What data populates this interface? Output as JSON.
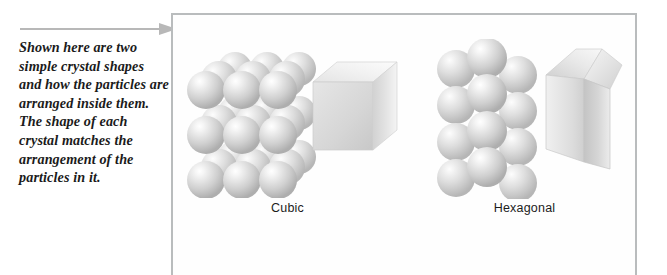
{
  "caption": {
    "text": "Shown here are two simple crystal shapes and how the particles are arranged inside them. The shape of each crystal matches the arrangement of the particles in it."
  },
  "arrow": {
    "icon": "arrow-right-icon",
    "color": "#b8b8b8",
    "direction": "right"
  },
  "panel": {
    "border_color": "#b9bcbd",
    "background": "#fefefe"
  },
  "figures": [
    {
      "id": "cubic",
      "label": "Cubic",
      "lattice_icon": "cubic-lattice-icon",
      "solid_icon": "cube-icon",
      "lattice": {
        "type": "cubic",
        "rows": 3,
        "columns": 3,
        "layers": 3,
        "sphere_color": "#d4d4d4"
      },
      "solid": {
        "type": "cube",
        "top_face_color": "#ededed",
        "front_face_color": "#d9d9d9",
        "side_face_color": "#c6c6c6"
      }
    },
    {
      "id": "hexagonal",
      "label": "Hexagonal",
      "lattice_icon": "hexagonal-lattice-icon",
      "solid_icon": "hexagonal-prism-icon",
      "lattice": {
        "type": "hexagonal",
        "rows": 4,
        "columns": 3,
        "sphere_color": "#d4d4d4"
      },
      "solid": {
        "type": "hexagonal-prism",
        "top_face_color": "#e8e8e8",
        "front_face_color": "#dcdcdc",
        "side_face_color": "#c4c4c4"
      }
    }
  ]
}
